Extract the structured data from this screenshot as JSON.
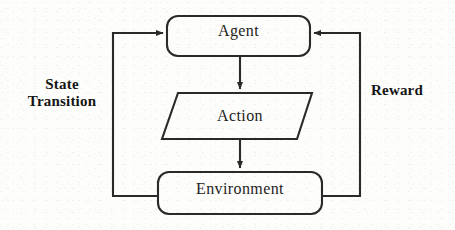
{
  "diagram": {
    "type": "flowchart",
    "background_color": "#fdfdfc",
    "stroke_color": "#2a2a2a",
    "text_color": "#1d1d1d",
    "nodes": [
      {
        "id": "agent",
        "label": "Agent",
        "shape": "rounded-rectangle",
        "x": 167,
        "y": 16,
        "width": 143,
        "height": 40
      },
      {
        "id": "action",
        "label": "Action",
        "shape": "parallelogram",
        "x": 162,
        "y": 93,
        "width": 150,
        "height": 46
      },
      {
        "id": "environment",
        "label": "Environment",
        "shape": "rounded-rectangle",
        "x": 158,
        "y": 172,
        "width": 164,
        "height": 42
      }
    ],
    "edges": [
      {
        "id": "agent-to-action",
        "from": "agent",
        "to": "action",
        "label": "",
        "direction": "down"
      },
      {
        "id": "action-to-environment",
        "from": "action",
        "to": "environment",
        "label": "",
        "direction": "down"
      },
      {
        "id": "environment-to-agent-left",
        "from": "environment",
        "to": "agent",
        "label": "State Transition",
        "label_line_1": "State",
        "label_line_2": "Transition",
        "direction": "left-loop-up"
      },
      {
        "id": "environment-to-agent-right",
        "from": "environment",
        "to": "agent",
        "label": "Reward",
        "direction": "right-loop-up"
      }
    ]
  }
}
